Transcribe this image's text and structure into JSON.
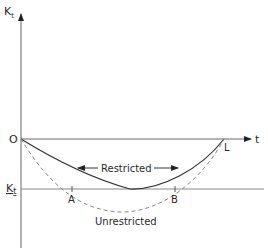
{
  "diagram": {
    "y_axis_label": "K",
    "y_axis_label_sub": "t",
    "x_axis_label": "t",
    "origin_label": "O",
    "level_label": "K",
    "level_label_sub": "t",
    "point_a": "A",
    "point_b": "B",
    "point_l": "L",
    "restricted_label": "Restricted",
    "unrestricted_label": "Unrestricted",
    "colors": {
      "line": "#333333",
      "axis": "#555555",
      "dashed": "#888888"
    }
  }
}
